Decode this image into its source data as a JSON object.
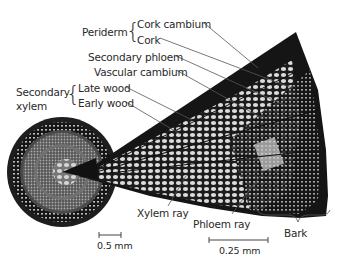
{
  "figure": {
    "type": "stem cross-section with magnified wedge",
    "labels": {
      "periderm": "Periderm",
      "cork_cambium": "Cork cambium",
      "cork": "Cork",
      "secondary_phloem": "Secondary phloem",
      "vascular_cambium": "Vascular cambium",
      "secondary_xylem_line1": "Secondary",
      "secondary_xylem_line2": "xylem",
      "late_wood": "Late wood",
      "early_wood": "Early wood",
      "xylem_ray": "Xylem ray",
      "phloem_ray": "Phloem ray",
      "bark": "Bark"
    },
    "scale_bars": {
      "whole_stem": "0.5 mm",
      "magnified": "0.25 mm"
    },
    "colors": {
      "tissue_dark": "#1a1a1a",
      "tissue_light": "#d8d8d8",
      "leader_line": "#555555",
      "text": "#2a2a2a"
    }
  }
}
